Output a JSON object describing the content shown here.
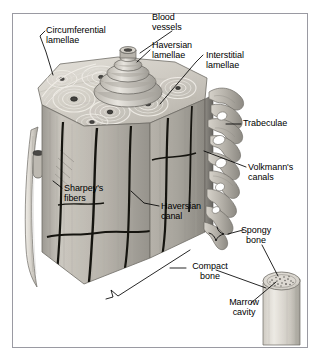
{
  "figure": {
    "kind": "anatomical-illustration",
    "frame_color": "#9a9aa2",
    "background_color": "#ffffff",
    "leader_line_color": "#000000",
    "bone_tone_light": "#d8d5cf",
    "bone_tone_mid": "#aaa79f",
    "bone_tone_dark": "#7d7a73"
  },
  "labels": [
    {
      "id": "circumferential-lamellae",
      "text": "Circumferential\nlamellae",
      "x": 46,
      "y": 26,
      "align": "left"
    },
    {
      "id": "blood-vessels",
      "text": "Blood\nvessels",
      "x": 152,
      "y": 13,
      "align": "left"
    },
    {
      "id": "haversian-lamellae",
      "text": "Haversian\nlamellae",
      "x": 152,
      "y": 41,
      "align": "left"
    },
    {
      "id": "interstitial-lamellae",
      "text": "Interstitial\nlamellae",
      "x": 206,
      "y": 51,
      "align": "left"
    },
    {
      "id": "trabeculae",
      "text": "Trabeculae",
      "x": 243,
      "y": 122,
      "align": "left"
    },
    {
      "id": "volkmanns-canals",
      "text": "Volkmann's\ncanals",
      "x": 248,
      "y": 163,
      "align": "left"
    },
    {
      "id": "sharpeys-fibers",
      "text": "Sharpey's\nfibers",
      "x": 64,
      "y": 184,
      "align": "left"
    },
    {
      "id": "haversian-canal",
      "text": "Haversian\ncanal",
      "x": 161,
      "y": 202,
      "align": "left"
    },
    {
      "id": "spongy-bone",
      "text": "Spongy\nbone",
      "x": 275,
      "y": 228,
      "align": "right"
    },
    {
      "id": "compact-bone",
      "text": "Compact\nbone",
      "x": 229,
      "y": 264,
      "align": "right"
    },
    {
      "id": "marrow-cavity",
      "text": "Marrow\ncavity",
      "x": 265,
      "y": 300,
      "align": "right"
    }
  ],
  "structures": [
    {
      "id": "osteon-top-face",
      "name": "cut top face with concentric lamellae"
    },
    {
      "id": "blood-vessel-stack",
      "name": "stacked blood vessel entering haversian canal"
    },
    {
      "id": "compact-bone-shaft",
      "name": "compact bone column"
    },
    {
      "id": "periosteum-flap",
      "name": "peeled periosteum flap on left"
    },
    {
      "id": "trabecular-projections",
      "name": "spongy bone trabeculae on right"
    },
    {
      "id": "long-bone-cylinder",
      "name": "long bone cylinder with marrow cavity"
    }
  ]
}
